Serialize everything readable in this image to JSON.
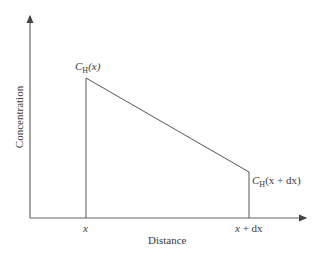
{
  "diagram": {
    "y_axis_label": "Concentration",
    "x_axis_label": "Distance",
    "x_tick_left": "x",
    "x_tick_right_var": "x",
    "x_tick_right_rest": " + dx",
    "point_left": {
      "symbol": "C",
      "subscript": "H",
      "arg": "(x)"
    },
    "point_right": {
      "symbol": "C",
      "subscript": "H",
      "arg": "(x + dx)"
    },
    "line_color": "#555555"
  }
}
